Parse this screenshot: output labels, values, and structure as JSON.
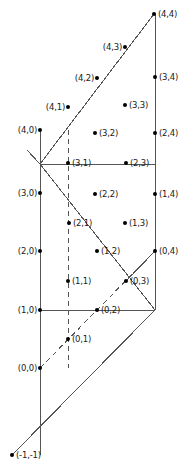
{
  "figure": {
    "width": 194,
    "height": 475,
    "background": "#ffffff",
    "stroke_color": "#555555",
    "dot_color": "#000000",
    "text_color": "#1a1a1a"
  },
  "points": [
    {
      "label": "(4,4)",
      "x": 154,
      "y": 14,
      "side": "right",
      "dot": true
    },
    {
      "label": "(4,3)",
      "x": 125,
      "y": 47,
      "side": "left",
      "dot": true
    },
    {
      "label": "(3,4)",
      "x": 155,
      "y": 77,
      "side": "right",
      "dot": true
    },
    {
      "label": "(4,2)",
      "x": 97,
      "y": 78,
      "side": "left",
      "dot": true
    },
    {
      "label": "(3,3)",
      "x": 125,
      "y": 105,
      "side": "right",
      "dot": true
    },
    {
      "label": "(4,1)",
      "x": 68,
      "y": 107,
      "side": "left",
      "dot": true
    },
    {
      "label": "(4,0)",
      "x": 40,
      "y": 130,
      "side": "left",
      "dot": true
    },
    {
      "label": "(3,2)",
      "x": 95,
      "y": 133,
      "side": "right",
      "dot": true
    },
    {
      "label": "(2,4)",
      "x": 155,
      "y": 133,
      "side": "right",
      "dot": true
    },
    {
      "label": "(3,1)",
      "x": 68,
      "y": 163,
      "side": "right",
      "dot": true
    },
    {
      "label": "(2,3)",
      "x": 126,
      "y": 163,
      "side": "right",
      "dot": true
    },
    {
      "label": "(3,0)",
      "x": 40,
      "y": 193,
      "side": "left",
      "dot": true
    },
    {
      "label": "(2,2)",
      "x": 95,
      "y": 194,
      "side": "right",
      "dot": true
    },
    {
      "label": "(1,4)",
      "x": 155,
      "y": 194,
      "side": "right",
      "dot": true
    },
    {
      "label": "(2,1)",
      "x": 69,
      "y": 223,
      "side": "right",
      "dot": true
    },
    {
      "label": "(1,3)",
      "x": 125,
      "y": 223,
      "side": "right",
      "dot": true
    },
    {
      "label": "(2,0)",
      "x": 40,
      "y": 251,
      "side": "left",
      "dot": true
    },
    {
      "label": "(1,2)",
      "x": 97,
      "y": 251,
      "side": "right",
      "dot": true
    },
    {
      "label": "(0,4)",
      "x": 155,
      "y": 251,
      "side": "right",
      "dot": true
    },
    {
      "label": "(1,1)",
      "x": 68,
      "y": 281,
      "side": "right",
      "dot": true
    },
    {
      "label": "(0,3)",
      "x": 126,
      "y": 281,
      "side": "right",
      "dot": true
    },
    {
      "label": "(1,0)",
      "x": 40,
      "y": 310,
      "side": "left",
      "dot": true
    },
    {
      "label": "(0,2)",
      "x": 97,
      "y": 310,
      "side": "right",
      "dot": true
    },
    {
      "label": "(0,1)",
      "x": 68,
      "y": 339,
      "side": "right",
      "dot": true
    },
    {
      "label": "(0,0)",
      "x": 40,
      "y": 368,
      "side": "left",
      "dot": true
    },
    {
      "label": "(-1,-1)",
      "x": 12,
      "y": 455,
      "side": "right",
      "dot": true
    }
  ],
  "solid_lines": [
    {
      "name": "vertical-right-edge",
      "x1": 155,
      "y1": 14,
      "x2": 155,
      "y2": 310
    },
    {
      "name": "diagonal-up-left-to-top-right",
      "x1": 40,
      "y1": 164,
      "x2": 154,
      "y2": 14
    },
    {
      "name": "horizontal-upper",
      "x1": 40,
      "y1": 164,
      "x2": 155,
      "y2": 164
    },
    {
      "name": "diagonal-apex-to-four-zero",
      "x1": 40,
      "y1": 164,
      "x2": 40,
      "y2": 130
    },
    {
      "name": "diagonal-four-zero-to-apex",
      "x1": 40,
      "y1": 130,
      "x2": 40,
      "y2": 164
    },
    {
      "name": "vertical-left-edge",
      "x1": 40,
      "y1": 130,
      "x2": 40,
      "y2": 455
    },
    {
      "name": "diagonal-descending-main",
      "x1": 40,
      "y1": 164,
      "x2": 155,
      "y2": 310
    },
    {
      "name": "horizontal-lower",
      "x1": 40,
      "y1": 310,
      "x2": 155,
      "y2": 310
    },
    {
      "name": "diagonal-bottom-long",
      "x1": 12,
      "y1": 455,
      "x2": 155,
      "y2": 310
    },
    {
      "name": "diagonal-zero-three-to-zero-four",
      "x1": 126,
      "y1": 281,
      "x2": 155,
      "y2": 251
    },
    {
      "name": "diagonal-apex-edge-short",
      "x1": 27,
      "y1": 150,
      "x2": 40,
      "y2": 164
    }
  ],
  "dashed_lines": [
    {
      "name": "dashed-vertical-guide",
      "x1": 68,
      "y1": 130,
      "x2": 68,
      "y2": 368
    },
    {
      "name": "dashed-diagonal-lower",
      "x1": 40,
      "y1": 368,
      "x2": 155,
      "y2": 251
    }
  ]
}
